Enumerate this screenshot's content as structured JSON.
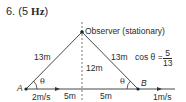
{
  "header": {
    "number": "6.",
    "answer_open": "(5 ",
    "answer_unit": "Hz",
    "answer_close": ")"
  },
  "diagram": {
    "observer_label": "Observer (stationary)",
    "point_a": "A",
    "point_b": "B",
    "side_left": "13m",
    "side_right": "13m",
    "height": "12m",
    "base_left": "5m",
    "base_right": "5m",
    "speed_a": "2m/s",
    "speed_b": "1m/s",
    "angle_left": "θ",
    "angle_right": "θ",
    "cos_label": "cos θ =",
    "cos_num": "5",
    "cos_den": "13"
  }
}
